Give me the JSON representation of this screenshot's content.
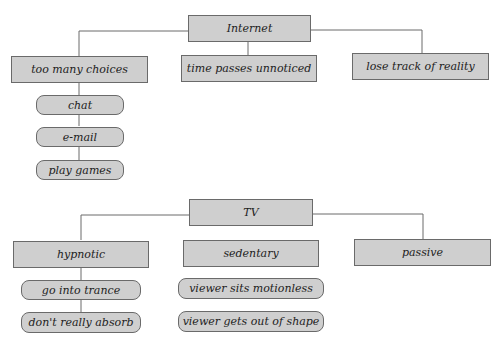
{
  "diagrams": [
    {
      "root": {
        "label": "Internet"
      },
      "children": [
        {
          "label": "too many choices",
          "subitems": [
            {
              "label": "chat"
            },
            {
              "label": "e-mail"
            },
            {
              "label": "play games"
            }
          ]
        },
        {
          "label": "time passes unnoticed",
          "subitems": []
        },
        {
          "label": "lose track of reality",
          "subitems": []
        }
      ]
    },
    {
      "root": {
        "label": "TV"
      },
      "children": [
        {
          "label": "hypnotic",
          "subitems": [
            {
              "label": "go into trance"
            },
            {
              "label": "don't really absorb"
            }
          ]
        },
        {
          "label": "sedentary",
          "subitems": [
            {
              "label": "viewer sits motionless"
            },
            {
              "label": "viewer gets out of shape"
            }
          ]
        },
        {
          "label": "passive",
          "subitems": []
        }
      ]
    }
  ],
  "colors": {
    "box_fill": "#cfcfcf",
    "box_border": "#6a6a6a",
    "line": "#6a6a6a",
    "text": "#222222"
  }
}
